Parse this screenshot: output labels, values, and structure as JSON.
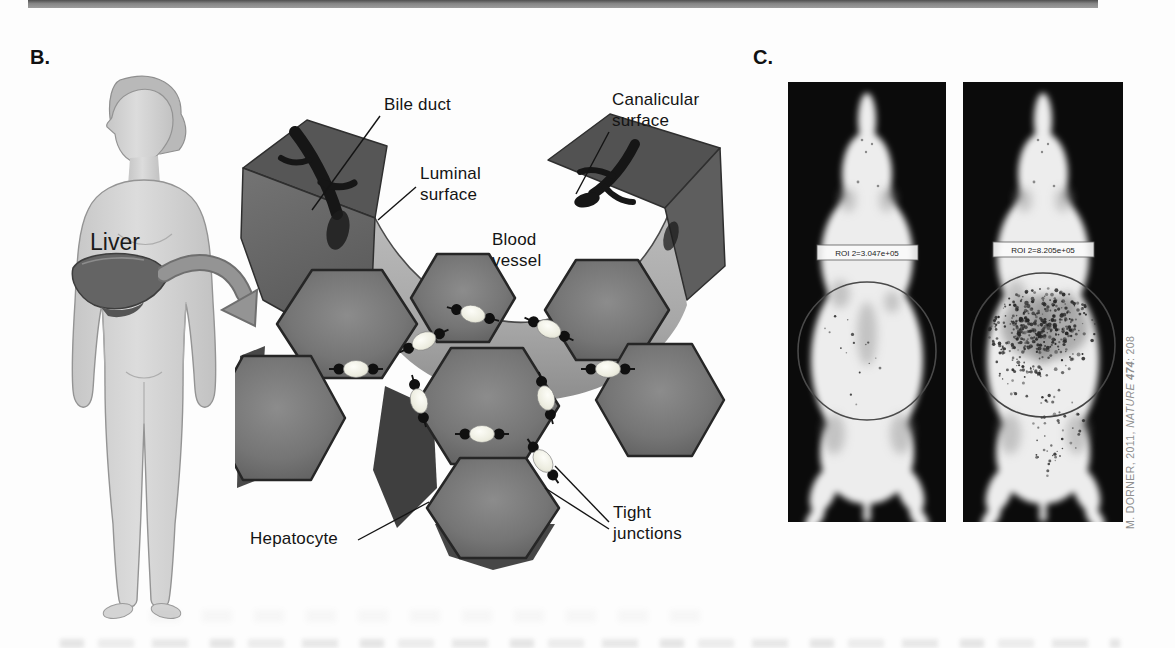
{
  "figure": {
    "panel_b": {
      "letter": "B.",
      "liver_label": "Liver",
      "labels": {
        "bile_duct": "Bile duct",
        "luminal_surface": "Luminal\nsurface",
        "canalicular_surface": "Canalicular\nsurface",
        "blood_vessel": "Blood\nvessel",
        "hepatocyte": "Hepatocyte",
        "tight_junctions": "Tight\njunctions"
      }
    },
    "panel_c": {
      "letter": "C.",
      "mice": [
        {
          "roi_label": "ROI 2=3.047e+05"
        },
        {
          "roi_label": "ROI 2=8.205e+05"
        }
      ],
      "credit": {
        "prefix": "M. DORNER, 2011, ",
        "journal": "NATURE",
        "volume": " 474",
        "suffix": ": 208"
      }
    }
  }
}
